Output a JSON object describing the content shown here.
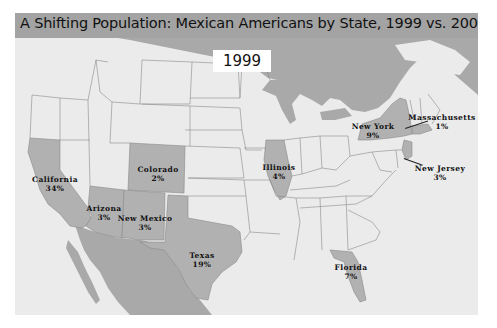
{
  "title": "A Shifting Population: Mexican Americans by State, 1999 vs. 2006",
  "year_badge": "1999",
  "colors": {
    "land": "#ebebeb",
    "highlighted_state": "#b1b1b1",
    "water_foreign": "#a9a9a9",
    "title_bar": "#a3a3a3",
    "border": "#8a8a8a"
  },
  "states": [
    {
      "name": "California",
      "value": "34%",
      "x": 55,
      "y": 175
    },
    {
      "name": "Arizona",
      "value": "3%",
      "x": 104,
      "y": 204
    },
    {
      "name": "New Mexico",
      "value": "3%",
      "x": 145,
      "y": 214
    },
    {
      "name": "Colorado",
      "value": "2%",
      "x": 158,
      "y": 165
    },
    {
      "name": "Texas",
      "value": "19%",
      "x": 202,
      "y": 251
    },
    {
      "name": "Illinois",
      "value": "4%",
      "x": 279,
      "y": 163
    },
    {
      "name": "Florida",
      "value": "7%",
      "x": 351,
      "y": 263
    },
    {
      "name": "New York",
      "value": "9%",
      "x": 373,
      "y": 122
    },
    {
      "name": "Massachusetts",
      "value": "1%",
      "x": 442,
      "y": 113
    },
    {
      "name": "New Jersey",
      "value": "3%",
      "x": 440,
      "y": 164
    }
  ]
}
